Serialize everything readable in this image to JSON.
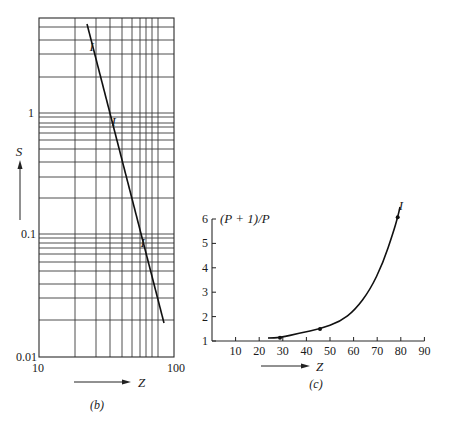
{
  "chart_data": [
    {
      "id": "b",
      "type": "line",
      "caption": "(b)",
      "title": "",
      "xlabel": "Z",
      "ylabel": "S",
      "xscale": "log",
      "yscale": "log",
      "xlim": [
        10,
        100
      ],
      "ylim": [
        0.01,
        6
      ],
      "x_tick_labels": [
        "10",
        "100"
      ],
      "y_tick_labels": [
        "0.01",
        "0.1",
        "1"
      ],
      "grid": true,
      "series": [
        {
          "name": "S vs Z (log-log fit)",
          "points": [
            [
              24,
              5.2
            ],
            [
              25,
              3.5
            ],
            [
              36,
              0.85
            ],
            [
              59,
              0.085
            ],
            [
              86,
              0.019
            ]
          ],
          "markers": [
            {
              "x": 25,
              "y": 3.5,
              "label": "I"
            },
            {
              "x": 36,
              "y": 0.85,
              "label": "I"
            },
            {
              "x": 59,
              "y": 0.085,
              "label": "I"
            }
          ]
        }
      ],
      "annotations": [
        "Z arrow pointing right",
        "S arrow pointing up"
      ]
    },
    {
      "id": "c",
      "type": "line",
      "caption": "(c)",
      "title": "",
      "xlabel": "Z",
      "ylabel": "(P + 1)/P",
      "xlim": [
        0,
        90
      ],
      "ylim": [
        1,
        6
      ],
      "x_ticks": [
        10,
        20,
        30,
        40,
        50,
        60,
        70,
        80,
        90
      ],
      "y_ticks": [
        1,
        2,
        3,
        4,
        5,
        6
      ],
      "grid": false,
      "series": [
        {
          "name": "(P+1)/P vs Z",
          "points": [
            [
              24,
              1.12
            ],
            [
              29,
              1.14
            ],
            [
              46,
              1.49
            ],
            [
              54,
              1.8
            ],
            [
              67,
              2.1
            ],
            [
              73,
              3.1
            ],
            [
              77,
              4.3
            ],
            [
              79,
              6.05
            ],
            [
              80,
              6.5
            ]
          ],
          "markers": [
            {
              "x": 29,
              "y": 1.14
            },
            {
              "x": 46,
              "y": 1.49
            },
            {
              "x": 79,
              "y": 6.05
            }
          ],
          "end_label": "I"
        }
      ],
      "annotations": [
        "Z arrow pointing right",
        "curve label I at top end"
      ]
    }
  ],
  "labels": {
    "b_caption": "(b)",
    "c_caption": "(c)",
    "b_xlabel": "Z",
    "b_ylabel": "S",
    "c_xlabel": "Z",
    "c_ylabel": "(P + 1)/P",
    "b_xticks": [
      "10",
      "100"
    ],
    "b_yticks": [
      "1",
      "0.1",
      "0.01"
    ],
    "c_xticks": [
      "10",
      "20",
      "30",
      "40",
      "50",
      "60",
      "70",
      "80",
      "90"
    ],
    "c_yticks": [
      "1",
      "2",
      "3",
      "4",
      "5",
      "6"
    ],
    "marker_label": "I",
    "c_end_label": "I"
  },
  "layout": {
    "b": {
      "frame": {
        "left": 39,
        "right": 174,
        "top": 18,
        "bottom": 357
      },
      "vgrid_px": [
        75,
        96,
        110,
        122,
        132,
        140,
        146,
        152,
        158
      ],
      "hgrid_px": [
        27,
        40,
        54,
        77,
        113,
        117,
        123,
        127,
        133,
        140,
        149,
        162,
        177,
        198,
        234,
        238,
        243,
        248,
        254,
        262,
        271,
        284,
        298,
        320
      ],
      "line_px": [
        [
          87,
          24
        ],
        [
          164,
          323
        ]
      ],
      "marker_px": [
        [
          91.7,
          46.7
        ],
        [
          113.7,
          121.7
        ],
        [
          142.7,
          242.7
        ]
      ]
    },
    "c": {
      "origin_px": [
        212,
        341
      ],
      "x_px_per_unit": 2.36,
      "y_px_per_unit": 24.4,
      "curve_px": [
        [
          268,
          338
        ],
        [
          280,
          337.7
        ],
        [
          300,
          333
        ],
        [
          320,
          329
        ],
        [
          340,
          321.7
        ],
        [
          355,
          310
        ],
        [
          370,
          290
        ],
        [
          383,
          263
        ],
        [
          393,
          233
        ],
        [
          397.7,
          217.3
        ],
        [
          400,
          207
        ]
      ],
      "marker_px": [
        [
          280,
          337.7
        ],
        [
          320,
          329
        ],
        [
          397.7,
          217.3
        ]
      ]
    }
  },
  "colors": {
    "ink": "#1a1a1a",
    "grid": "#3a3a3a",
    "background": "#ffffff"
  }
}
